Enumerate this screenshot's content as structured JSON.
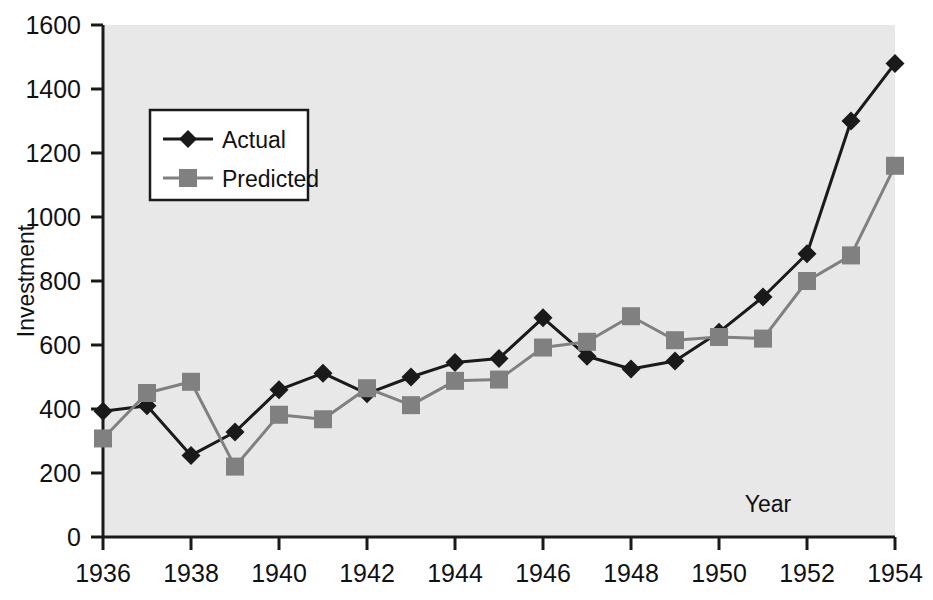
{
  "chart_data": {
    "type": "line",
    "title": "",
    "xlabel": "Year",
    "ylabel": "Investment",
    "xlim": [
      1936,
      1954
    ],
    "ylim": [
      0,
      1600
    ],
    "xticks": [
      1936,
      1938,
      1940,
      1942,
      1944,
      1946,
      1948,
      1950,
      1952,
      1954
    ],
    "xtick_labels": [
      "1936",
      "1938",
      "1940",
      "1942",
      "1944",
      "1946",
      "1948",
      "1950",
      "1952",
      "1954"
    ],
    "yticks": [
      0,
      200,
      400,
      600,
      800,
      1000,
      1200,
      1400,
      1600
    ],
    "ytick_labels": [
      "0",
      "200",
      "400",
      "600",
      "800",
      "1000",
      "1200",
      "1400",
      "1600"
    ],
    "grid": false,
    "legend_position": "upper-left-inset",
    "plot_background": "#e8e8e8",
    "x": [
      1936,
      1937,
      1938,
      1939,
      1940,
      1941,
      1942,
      1943,
      1944,
      1945,
      1946,
      1947,
      1948,
      1949,
      1950,
      1951,
      1952,
      1953,
      1954
    ],
    "series": [
      {
        "name": "Actual",
        "color": "#1a1a1a",
        "marker": "diamond",
        "values": [
          393,
          410,
          255,
          328,
          460,
          512,
          448,
          500,
          545,
          558,
          685,
          565,
          525,
          550,
          640,
          750,
          885,
          1300,
          1480
        ]
      },
      {
        "name": "Predicted",
        "color": "#808080",
        "marker": "square",
        "values": [
          308,
          450,
          485,
          220,
          382,
          368,
          465,
          412,
          488,
          492,
          592,
          610,
          690,
          615,
          625,
          620,
          800,
          880,
          1160
        ]
      }
    ]
  },
  "legend": {
    "entries": [
      {
        "label": "Actual"
      },
      {
        "label": "Predicted"
      }
    ]
  },
  "axes": {
    "y_title": "Investment",
    "x_title": "Year"
  },
  "colors": {
    "actual": "#1a1a1a",
    "predicted": "#808080",
    "plot_bg": "#e8e8e8",
    "axis": "#1a1a1a",
    "page_bg": "#ffffff"
  }
}
